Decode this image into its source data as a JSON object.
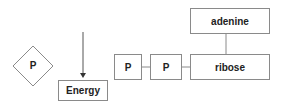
{
  "diagram": {
    "free_phosphate": {
      "label": "P",
      "shape": "diamond"
    },
    "arrow": {
      "direction": "down",
      "target": "Energy"
    },
    "energy": {
      "label": "Energy"
    },
    "phosphates": [
      {
        "label": "P"
      },
      {
        "label": "P"
      }
    ],
    "ribose": {
      "label": "ribose"
    },
    "adenine": {
      "label": "adenine"
    },
    "colors": {
      "stroke": "#8a8a8a",
      "text": "#222222",
      "background": "#ffffff"
    }
  }
}
